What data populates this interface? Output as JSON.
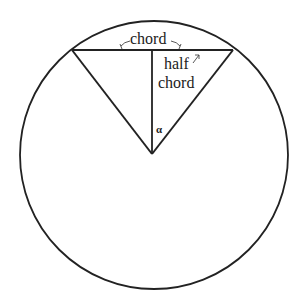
{
  "diagram": {
    "colors": {
      "stroke": "#222222",
      "background": "#ffffff"
    },
    "circle": {
      "cx": 154,
      "cy": 155,
      "r": 134
    },
    "center": {
      "x": 152,
      "y": 154
    },
    "chord": {
      "x1": 72,
      "y1": 50,
      "x2": 233,
      "y2": 50
    },
    "labels": {
      "chord": "chord",
      "half_chord_line1": "half",
      "half_chord_line2": "chord",
      "angle": "α"
    }
  }
}
